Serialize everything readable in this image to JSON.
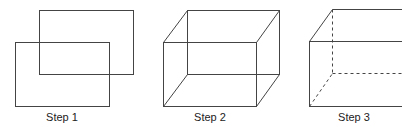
{
  "steps": [
    {
      "label": "Step 1",
      "description": "Two overlapping rectangles"
    },
    {
      "label": "Step 2",
      "description": "Corners connected to form a wireframe box"
    },
    {
      "label": "Step 3",
      "description": "Hidden edges shown as dashed lines"
    }
  ],
  "colors": {
    "stroke": "#444444",
    "text": "#222222",
    "background": "#ffffff"
  }
}
